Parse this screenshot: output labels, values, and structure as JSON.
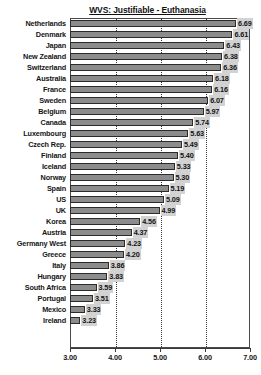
{
  "chart_data": {
    "type": "bar",
    "orientation": "horizontal",
    "title": "WVS: Justifiable - Euthanasia",
    "xlabel": "",
    "ylabel": "",
    "xlim": [
      3.0,
      7.0
    ],
    "grid": true,
    "legend": null,
    "xticks": [
      "3.00",
      "4.00",
      "5.00",
      "6.00",
      "7.00"
    ],
    "xtick_values": [
      3,
      4,
      5,
      6,
      7
    ],
    "categories": [
      "Netherlands",
      "Denmark",
      "Japan",
      "New Zealand",
      "Switzerland",
      "Australia",
      "France",
      "Sweden",
      "Belgium",
      "Canada",
      "Luxembourg",
      "Czech Rep.",
      "Finland",
      "Iceland",
      "Norway",
      "Spain",
      "US",
      "UK",
      "Korea",
      "Austria",
      "Germany West",
      "Greece",
      "Italy",
      "Hungary",
      "South Africa",
      "Portugal",
      "Mexico",
      "Ireland"
    ],
    "values": [
      6.69,
      6.61,
      6.43,
      6.38,
      6.36,
      6.18,
      6.16,
      6.07,
      5.97,
      5.74,
      5.63,
      5.49,
      5.4,
      5.33,
      5.3,
      5.19,
      5.09,
      4.99,
      4.56,
      4.37,
      4.23,
      4.2,
      3.86,
      3.83,
      3.59,
      3.51,
      3.33,
      3.23
    ],
    "value_labels": [
      "6.69",
      "6.61",
      "6.43",
      "6.38",
      "6.36",
      "6.18",
      "6.16",
      "6.07",
      "5.97",
      "5.74",
      "5.63",
      "5.49",
      "5.40",
      "5.33",
      "5.30",
      "5.19",
      "5.09",
      "4.99",
      "4.56",
      "4.37",
      "4.23",
      "4.20",
      "3.86",
      "3.83",
      "3.59",
      "3.51",
      "3.33",
      "3.23"
    ],
    "colors": {
      "bar_fill": "#8c8c8c",
      "bar_border": "#2b2b2b",
      "label_background": "#d2d2d2",
      "axis": "#3a3a3a",
      "text": "#151515",
      "plot_background": "#ffffff"
    }
  }
}
